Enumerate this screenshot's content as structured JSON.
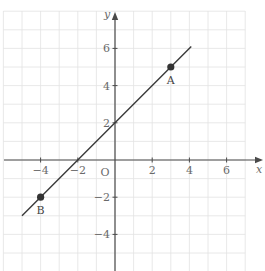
{
  "chart_data": {
    "type": "line",
    "title": "",
    "xlabel": "x",
    "ylabel": "y",
    "origin_label": "O",
    "xlim": [
      -6,
      7
    ],
    "ylim": [
      -6,
      8
    ],
    "grid": true,
    "grid_step": 1,
    "x_ticks": [
      -4,
      -2,
      2,
      4,
      6
    ],
    "x_tick_labels": [
      "−4",
      "−2",
      "2",
      "4",
      "6"
    ],
    "y_ticks": [
      6,
      4,
      2,
      -2,
      -4
    ],
    "y_tick_labels": [
      "6",
      "4",
      "2",
      "−2",
      "−4"
    ],
    "series": [
      {
        "name": "y = x + 2",
        "x": [
          -5,
          4.1
        ],
        "y": [
          -3,
          6.1
        ]
      }
    ],
    "points": [
      {
        "label": "A",
        "x": 3,
        "y": 5
      },
      {
        "label": "B",
        "x": -4,
        "y": -2
      }
    ],
    "colors": {
      "grid": "#e2e2e2",
      "axis": "#4a4a4a",
      "line": "#3a3a3a",
      "point": "#333333",
      "text": "#6a6a6a"
    }
  }
}
